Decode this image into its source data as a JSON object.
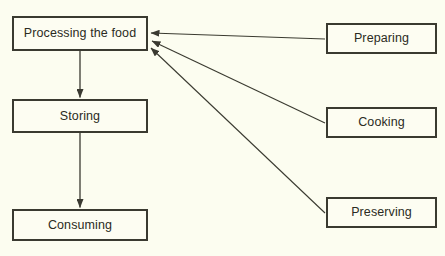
{
  "diagram": {
    "title": "Processing the food",
    "type": "flowchart",
    "background_color": "#fcfdf0",
    "line_color": "#3a3a30",
    "box_border_color": "#3a3a30",
    "text_color": "#2b2b22",
    "nodes": [
      {
        "id": "processing",
        "label": "Processing the food",
        "column": "left"
      },
      {
        "id": "storing",
        "label": "Storing",
        "column": "left"
      },
      {
        "id": "consuming",
        "label": "Consuming",
        "column": "left"
      },
      {
        "id": "preparing",
        "label": "Preparing",
        "column": "right"
      },
      {
        "id": "cooking",
        "label": "Cooking",
        "column": "right"
      },
      {
        "id": "preserving",
        "label": "Preserving",
        "column": "right"
      }
    ],
    "edges": [
      {
        "from": "processing",
        "to": "storing",
        "style": "straight-vertical",
        "arrow": "end"
      },
      {
        "from": "storing",
        "to": "consuming",
        "style": "straight-vertical",
        "arrow": "end"
      },
      {
        "from": "preparing",
        "to": "processing",
        "style": "diagonal",
        "arrow": "end"
      },
      {
        "from": "cooking",
        "to": "processing",
        "style": "diagonal",
        "arrow": "end"
      },
      {
        "from": "preserving",
        "to": "processing",
        "style": "diagonal",
        "arrow": "end"
      }
    ]
  }
}
